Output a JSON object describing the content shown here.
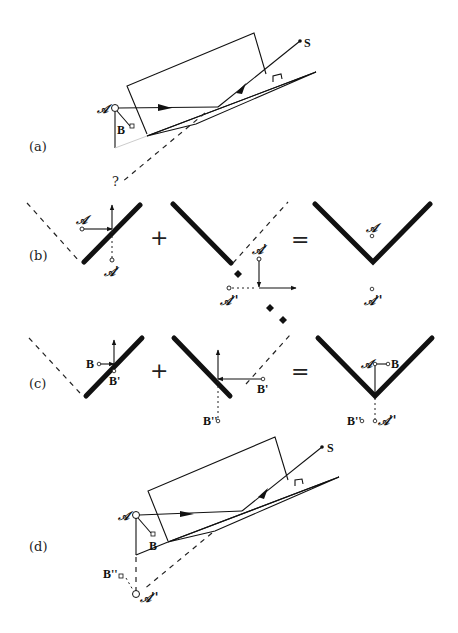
{
  "figure": {
    "panels": [
      {
        "id": "a",
        "label": "(a)",
        "points": {
          "A": "𝒜",
          "B": "B",
          "S": "S"
        },
        "unknown_marker": "?"
      },
      {
        "id": "b",
        "label": "(b)",
        "labels": {
          "A": "𝒜",
          "A_prime": "𝒜'",
          "A_double": "𝒜''"
        },
        "operators": {
          "plus": "+",
          "equals": "="
        }
      },
      {
        "id": "c",
        "label": "(c)",
        "labels": {
          "B": "B",
          "B_prime": "B'",
          "B_double": "B''",
          "A": "𝒜",
          "A_double": "𝒜''"
        },
        "operators": {
          "plus": "+",
          "equals": "="
        }
      },
      {
        "id": "d",
        "label": "(d)",
        "points": {
          "A": "𝒜",
          "B": "B",
          "S": "S",
          "B_double": "B''",
          "A_double": "𝒜''"
        }
      }
    ]
  }
}
